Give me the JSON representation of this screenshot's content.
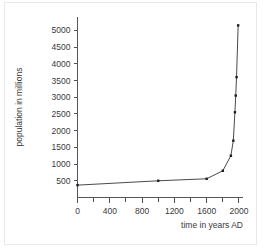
{
  "chart_data": {
    "type": "line",
    "title": "",
    "xlabel": "time in years AD",
    "ylabel": "population in millions",
    "xlim": [
      0,
      2050
    ],
    "ylim": [
      0,
      5400
    ],
    "grid": false,
    "legend": null,
    "x_major_ticks": [
      0,
      400,
      800,
      1200,
      1600,
      2000
    ],
    "x_major_tick_labels": [
      "0",
      "400",
      "800",
      "1200",
      "1600",
      "2000"
    ],
    "x_minor_ticks": [
      200,
      600,
      1000,
      1400,
      1800
    ],
    "y_ticks": [
      500,
      1000,
      1500,
      2000,
      2500,
      3000,
      3500,
      4000,
      4500,
      5000
    ],
    "y_tick_labels": [
      "500",
      "1000",
      "1500",
      "2000",
      "2500",
      "3000",
      "3500",
      "4000",
      "4500",
      "5000"
    ],
    "x": [
      0,
      1000,
      1600,
      1800,
      1900,
      1930,
      1950,
      1960,
      1970,
      1990
    ],
    "values": [
      370,
      500,
      560,
      800,
      1250,
      1700,
      2550,
      3050,
      3600,
      5150
    ],
    "markers": true,
    "marker_style": "square",
    "line_color": "#4a4a4a",
    "marker_color": "#1c1c1c"
  },
  "axis": {
    "x_title": "time in years AD",
    "y_title": "population in millions"
  }
}
